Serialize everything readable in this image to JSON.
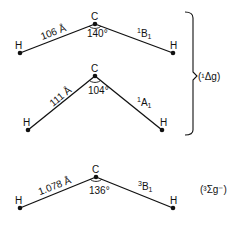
{
  "diagram": {
    "molecules": [
      {
        "name": "top",
        "atoms": {
          "left": "H",
          "center": "C",
          "right": "H"
        },
        "bond_length": "106 Å",
        "angle": "140°",
        "state": {
          "sup": "1",
          "letter": "B",
          "sub": "1"
        }
      },
      {
        "name": "middle",
        "atoms": {
          "left": "H",
          "center": "C",
          "right": "H"
        },
        "bond_length": "111 Å",
        "angle": "104°",
        "state": {
          "sup": "1",
          "letter": "A",
          "sub": "1"
        }
      },
      {
        "name": "bottom",
        "atoms": {
          "left": "H",
          "center": "C",
          "right": "H"
        },
        "bond_length": "1.078 Å",
        "angle": "136°",
        "state": {
          "sup": "3",
          "letter": "B",
          "sub": "1"
        }
      }
    ],
    "group_label": "(¹Δg)",
    "bottom_label": "(³Σg⁻)"
  }
}
